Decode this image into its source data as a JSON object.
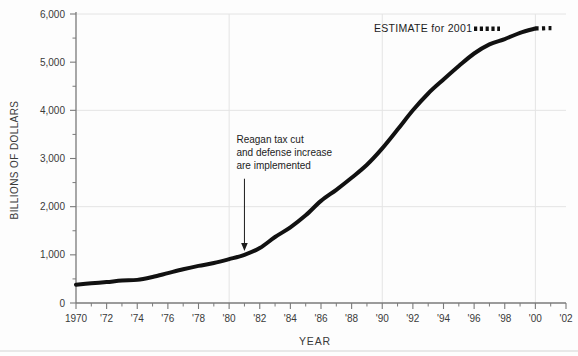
{
  "chart_data": {
    "type": "line",
    "title": "",
    "xlabel": "YEAR",
    "ylabel": "BILLIONS OF DOLLARS",
    "xlim": [
      1970,
      2002
    ],
    "ylim": [
      0,
      6000
    ],
    "grid": true,
    "grid_axis": "both",
    "grid_x_values": [
      1980,
      1990,
      2000
    ],
    "grid_y_values": [
      2000,
      4000,
      6000
    ],
    "legend_position": "top-right",
    "x_major_ticks": [
      1970,
      1972,
      1974,
      1976,
      1978,
      1980,
      1982,
      1984,
      1986,
      1988,
      1990,
      1992,
      1994,
      1996,
      1998,
      2000,
      2002
    ],
    "x_tick_labels": [
      "1970",
      "'72",
      "'74",
      "'76",
      "'78",
      "'80",
      "'82",
      "'84",
      "'86",
      "'88",
      "'90",
      "'92",
      "'94",
      "'96",
      "'98",
      "'00",
      "'02"
    ],
    "x_minor_ticks": [
      1971,
      1973,
      1975,
      1977,
      1979,
      1981,
      1983,
      1985,
      1987,
      1989,
      1991,
      1993,
      1995,
      1997,
      1999,
      2001
    ],
    "y_major_ticks": [
      0,
      1000,
      2000,
      3000,
      4000,
      5000,
      6000
    ],
    "y_tick_labels": [
      "0",
      "1,000",
      "2,000",
      "3,000",
      "4,000",
      "5,000",
      "6,000"
    ],
    "y_minor_ticks": [
      500,
      1500,
      2500,
      3500,
      4500,
      5500
    ],
    "series": [
      {
        "name": "Federal debt",
        "style": "solid",
        "color": "#111111",
        "x": [
          1970,
          1971,
          1972,
          1973,
          1974,
          1975,
          1976,
          1977,
          1978,
          1979,
          1980,
          1981,
          1982,
          1983,
          1984,
          1985,
          1986,
          1987,
          1988,
          1989,
          1990,
          1991,
          1992,
          1993,
          1994,
          1995,
          1996,
          1997,
          1998,
          1999,
          2000
        ],
        "values": [
          380,
          410,
          435,
          465,
          480,
          540,
          620,
          700,
          770,
          830,
          910,
          1000,
          1140,
          1370,
          1570,
          1820,
          2120,
          2350,
          2600,
          2870,
          3210,
          3600,
          4000,
          4350,
          4640,
          4920,
          5180,
          5370,
          5480,
          5610,
          5700
        ]
      },
      {
        "name": "ESTIMATE for 2001",
        "style": "dotted",
        "color": "#111111",
        "x": [
          2000,
          2000.35,
          2000.7,
          2001.05
        ],
        "values": [
          5700,
          5700,
          5705,
          5705
        ]
      }
    ],
    "legend": [
      {
        "label": "ESTIMATE for 2001",
        "style": "dotted",
        "color": "#111111"
      }
    ],
    "annotations": [
      {
        "name": "reagan-note",
        "lines": [
          "Reagan tax cut",
          "and defense increase",
          "are implemented"
        ],
        "arrow_x": 1981.0,
        "arrow_from_y": 2580,
        "arrow_to_y": 1080
      }
    ]
  },
  "colors": {
    "background": "#fdfdfd",
    "axis": "#7a7a7a",
    "grid": "#e4e4e4",
    "line": "#111111",
    "text": "#3a3a3a",
    "annotation_text": "#1c1c1c",
    "footer_rule": "#e0e0e0"
  }
}
